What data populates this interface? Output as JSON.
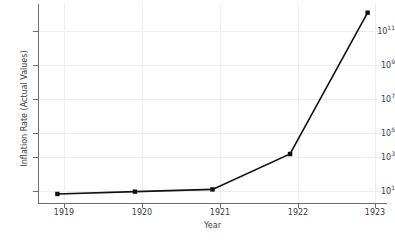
{
  "chart_data": {
    "type": "line",
    "title": "",
    "xlabel": "Year",
    "ylabel": "Inflation Rate (Actual Values)",
    "yscale": "log",
    "grid": true,
    "legend": "none",
    "x": [
      1919,
      1920,
      1921,
      1922,
      1923
    ],
    "xtick_labels": [
      "1919",
      "1920",
      "1921",
      "1922",
      "1923"
    ],
    "values": [
      4,
      5.5,
      7.5,
      1000,
      300000000000
    ],
    "series": [
      {
        "name": "Inflation Rate (Actual Values)",
        "values": [
          4,
          5.5,
          7.5,
          1000,
          300000000000
        ],
        "color": "#111111",
        "marker": "square",
        "linewidth": 1.6
      }
    ],
    "xlim": [
      1918.75,
      1923.25
    ],
    "ylim": [
      1,
      1000000000000
    ],
    "ytick_values": [
      10,
      1000,
      100000,
      10000000,
      1000000000,
      100000000000
    ],
    "ytick_labels": [
      "10¹",
      "10³",
      "10⁵",
      "10⁷",
      "10⁹",
      "10¹¹"
    ],
    "ytick_mantissas": [
      "10",
      "10",
      "10",
      "10",
      "10",
      "10"
    ],
    "ytick_exponents": [
      "1",
      "3",
      "5",
      "7",
      "9",
      "11"
    ],
    "annotations": []
  },
  "colors": {
    "background": "#ffffff",
    "grid": "#ececf1",
    "axis": "#6b6b70",
    "text": "#3c3c41",
    "series": "#111111"
  }
}
